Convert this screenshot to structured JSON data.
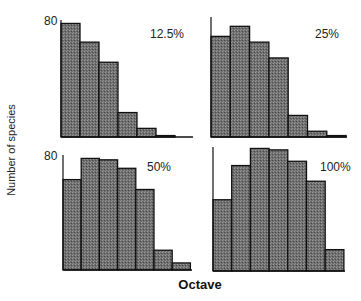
{
  "chart_data": {
    "type": "bar",
    "layout": "2x2 small multiples",
    "xlabel": "Octave",
    "ylabel": "Number of species",
    "y_tick_label": "80",
    "ylim": [
      0,
      90
    ],
    "grid": false,
    "bar_fill": "#7a7a7a",
    "bar_edge": "#111111",
    "panels": [
      {
        "label": "12.5%",
        "values": [
          79,
          66,
          52,
          17,
          6,
          1
        ]
      },
      {
        "label": "25%",
        "values": [
          70,
          77,
          66,
          55,
          15,
          4,
          1
        ]
      },
      {
        "label": "50%",
        "values": [
          64,
          79,
          78,
          72,
          57,
          14,
          5
        ]
      },
      {
        "label": "100%",
        "values": [
          50,
          74,
          86,
          85,
          77,
          63,
          15
        ]
      }
    ]
  }
}
